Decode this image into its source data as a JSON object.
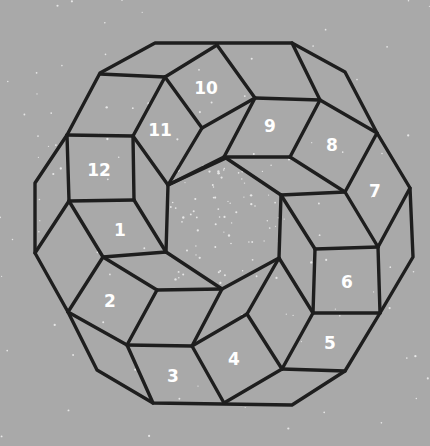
{
  "figure": {
    "background_color": "#a9a9a9",
    "line_color": "#1e1e1e",
    "label_color": "#ffffff",
    "cells": [
      {
        "label": "1",
        "x": 120,
        "y": 230
      },
      {
        "label": "2",
        "x": 110,
        "y": 301
      },
      {
        "label": "3",
        "x": 173,
        "y": 376
      },
      {
        "label": "4",
        "x": 234,
        "y": 359
      },
      {
        "label": "5",
        "x": 330,
        "y": 343
      },
      {
        "label": "6",
        "x": 347,
        "y": 282
      },
      {
        "label": "7",
        "x": 375,
        "y": 191
      },
      {
        "label": "8",
        "x": 332,
        "y": 145
      },
      {
        "label": "9",
        "x": 270,
        "y": 126
      },
      {
        "label": "10",
        "x": 206,
        "y": 88
      },
      {
        "label": "11",
        "x": 160,
        "y": 130
      },
      {
        "label": "12",
        "x": 99,
        "y": 170
      }
    ]
  }
}
